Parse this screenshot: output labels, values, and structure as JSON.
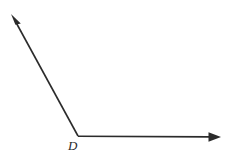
{
  "figure": {
    "kind": "geometry-angle-diagram",
    "background_color": "#ffffff",
    "stroke_color": "#2b2b2b",
    "canvas": {
      "width": 227,
      "height": 161
    },
    "vertex": {
      "label": "D",
      "x": 78,
      "y": 136,
      "label_x": 68,
      "label_y": 139
    },
    "rays": [
      {
        "name": "upper-left-ray",
        "from_x": 78,
        "from_y": 136,
        "to_x": 12,
        "to_y": 15,
        "arrow": "end"
      },
      {
        "name": "horizontal-right-ray",
        "from_x": 78,
        "from_y": 136,
        "to_x": 220,
        "to_y": 137,
        "arrow": "end"
      }
    ],
    "arrowheads": [
      {
        "name": "upper-left-arrowhead",
        "tip_x": 11,
        "tip_y": 14,
        "points": "11,14 20.6,23.2 15.6,24.4"
      },
      {
        "name": "right-arrowhead",
        "tip_x": 221,
        "tip_y": 137,
        "points": "221,137 208.5,132.2 208.5,141.8"
      }
    ]
  },
  "labels": {
    "vertex_d": "D"
  }
}
